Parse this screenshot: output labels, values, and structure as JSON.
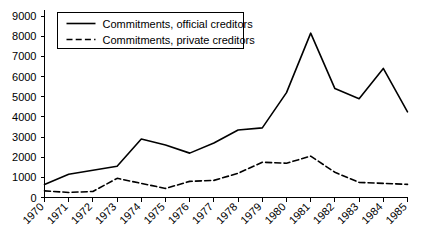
{
  "chart_data": {
    "type": "line",
    "title": "",
    "xlabel": "",
    "ylabel": "",
    "x": [
      "1970",
      "1971",
      "1972",
      "1973",
      "1974",
      "1975",
      "1976",
      "1977",
      "1978",
      "1979",
      "1980",
      "1981",
      "1982",
      "1983",
      "1984",
      "1985"
    ],
    "categories": [
      "1970",
      "1971",
      "1972",
      "1973",
      "1974",
      "1975",
      "1976",
      "1977",
      "1978",
      "1979",
      "1980",
      "1981",
      "1982",
      "1983",
      "1984",
      "1985"
    ],
    "series": [
      {
        "name": "Commitments, official creditors",
        "style": "solid",
        "color": "#000000",
        "values": [
          650,
          1150,
          1350,
          1550,
          2900,
          2600,
          2200,
          2700,
          3350,
          3450,
          5200,
          8150,
          5400,
          4900,
          6400,
          4250
        ]
      },
      {
        "name": "Commitments, private creditors",
        "style": "dashed",
        "color": "#000000",
        "values": [
          330,
          250,
          300,
          950,
          700,
          450,
          800,
          850,
          1200,
          1750,
          1700,
          2050,
          1250,
          750,
          700,
          650
        ]
      }
    ],
    "ylim": [
      0,
      9000
    ],
    "yticks": [
      0,
      1000,
      2000,
      3000,
      4000,
      5000,
      6000,
      7000,
      8000,
      9000
    ],
    "ytick_labels": [
      "0",
      "1000",
      "2000",
      "3000",
      "4000",
      "5000",
      "6000",
      "7000",
      "8000",
      "9000"
    ],
    "grid": false,
    "legend_position": "top-left",
    "legend": [
      "Commitments, official creditors",
      "Commitments, private creditors"
    ]
  }
}
